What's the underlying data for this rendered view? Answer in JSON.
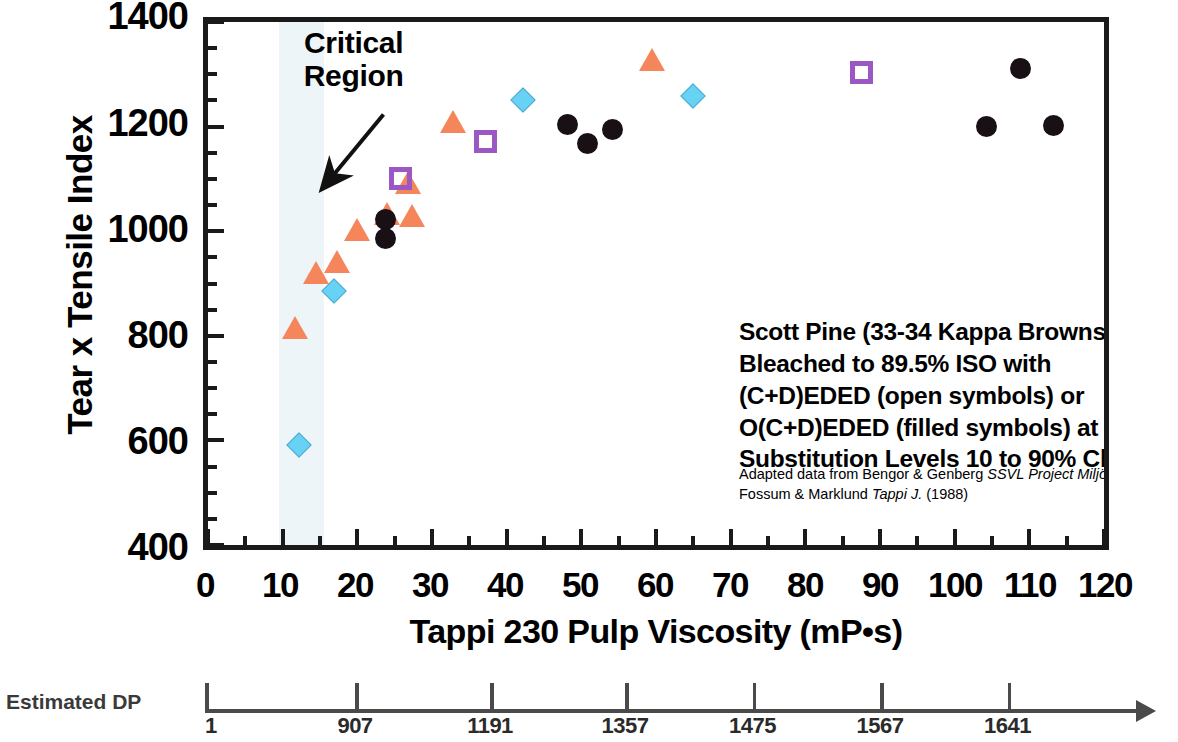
{
  "chart_data": {
    "type": "scatter",
    "title": "",
    "xlabel": "Tappi 230 Pulp Viscosity (mP•s)",
    "ylabel": "Tear x Tensile Index",
    "xlim": [
      0,
      120
    ],
    "ylim": [
      400,
      1400
    ],
    "x_ticks": [
      "0",
      "10",
      "20",
      "30",
      "40",
      "50",
      "60",
      "70",
      "80",
      "90",
      "100",
      "110",
      "120"
    ],
    "y_ticks": [
      "400",
      "600",
      "800",
      "1000",
      "1200",
      "1400"
    ],
    "x_tick_step": 10,
    "x_minor_step": 5,
    "y_tick_step": 200,
    "y_minor_step": 50,
    "grid": false,
    "legend": "none",
    "annotations": [
      {
        "name": "critical-region",
        "text": "Critical\nRegion",
        "arrow_from": [
          23.5,
          1223
        ],
        "arrow_to": [
          15.5,
          1085
        ],
        "band_x_range": [
          9.5,
          15.5
        ],
        "band_color": "#eef5f8"
      }
    ],
    "series": [
      {
        "name": "orange-triangle",
        "marker": "triangle",
        "color": "#f5865c",
        "filled": true,
        "points": [
          [
            11.7,
            815
          ],
          [
            14.5,
            920
          ],
          [
            17.3,
            942
          ],
          [
            20.0,
            1003
          ],
          [
            24.0,
            1033
          ],
          [
            26.8,
            1092
          ],
          [
            27.3,
            1030
          ],
          [
            32.8,
            1208
          ],
          [
            59.5,
            1328
          ]
        ]
      },
      {
        "name": "blue-diamond",
        "marker": "diamond",
        "color": "#68d2f5",
        "filled": true,
        "points": [
          [
            12.0,
            594
          ],
          [
            16.8,
            888
          ],
          [
            42.0,
            1253
          ],
          [
            64.8,
            1260
          ]
        ]
      },
      {
        "name": "purple-open-square",
        "marker": "square",
        "color": "#9b57c4",
        "filled": false,
        "points": [
          [
            25.8,
            1100
          ],
          [
            37.2,
            1172
          ],
          [
            87.5,
            1303
          ]
        ]
      },
      {
        "name": "black-filled-circle",
        "marker": "circle",
        "color": "#181014",
        "filled": true,
        "points": [
          [
            23.8,
            1022
          ],
          [
            23.8,
            986
          ],
          [
            48.2,
            1204
          ],
          [
            50.8,
            1168
          ],
          [
            54.2,
            1194
          ],
          [
            104.3,
            1201
          ],
          [
            108.8,
            1311
          ],
          [
            113.3,
            1202
          ]
        ]
      }
    ],
    "secondary_axis": {
      "name": "Estimated DP",
      "label": "Estimated DP",
      "ticks": [
        {
          "label": "1",
          "viscosity": 0
        },
        {
          "label": "907",
          "viscosity": 20
        },
        {
          "label": "1191",
          "viscosity": 38
        },
        {
          "label": "1357",
          "viscosity": 56
        },
        {
          "label": "1475",
          "viscosity": 73
        },
        {
          "label": "1567",
          "viscosity": 90
        },
        {
          "label": "1641",
          "viscosity": 107
        }
      ],
      "arrow": true
    }
  },
  "y_axis": {
    "title": "Tear x Tensile Index",
    "labels": [
      "1400",
      "1200",
      "1000",
      "800",
      "600",
      "400"
    ]
  },
  "x_axis": {
    "title": "Tappi 230 Pulp Viscosity (mP•s)",
    "labels": [
      "0",
      "10",
      "20",
      "30",
      "40",
      "50",
      "60",
      "70",
      "80",
      "90",
      "100",
      "110",
      "120"
    ]
  },
  "critical_region": {
    "line1": "Critical",
    "line2": "Region"
  },
  "description": {
    "line1": "Scott Pine (33-34 Kappa Brownstock)",
    "line2": "Bleached to 89.5% ISO with",
    "line3": "(C+D)EDED (open symbols) or",
    "line4": "O(C+D)EDED (filled symbols) at",
    "line5_a": "Substitution Levels 10 to 90% ClO",
    "line5_sub": "2"
  },
  "citation": {
    "line1_a": "Adapted data from Bengor & Genberg ",
    "line1_i": "SSVL Project Miljö 93",
    "line1_b": " (1991), and",
    "line2_a": "Fossum & Marklund ",
    "line2_i": "Tappi J.",
    "line2_b": " (1988)"
  },
  "dp_axis": {
    "label": "Estimated DP",
    "ticks": [
      "1",
      "907",
      "1191",
      "1357",
      "1475",
      "1567",
      "1641"
    ]
  }
}
